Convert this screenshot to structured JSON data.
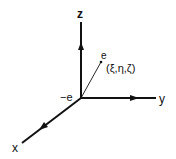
{
  "diagram": {
    "type": "3d-coordinate-axes",
    "axes": {
      "z": {
        "label": "z"
      },
      "y": {
        "label": "y"
      },
      "x": {
        "label": "x"
      }
    },
    "origin_label": "−e",
    "point": {
      "label": "e",
      "coords_label": "(ξ,η,ζ)"
    },
    "colors": {
      "ink": "#111111",
      "background": "#ffffff"
    }
  }
}
